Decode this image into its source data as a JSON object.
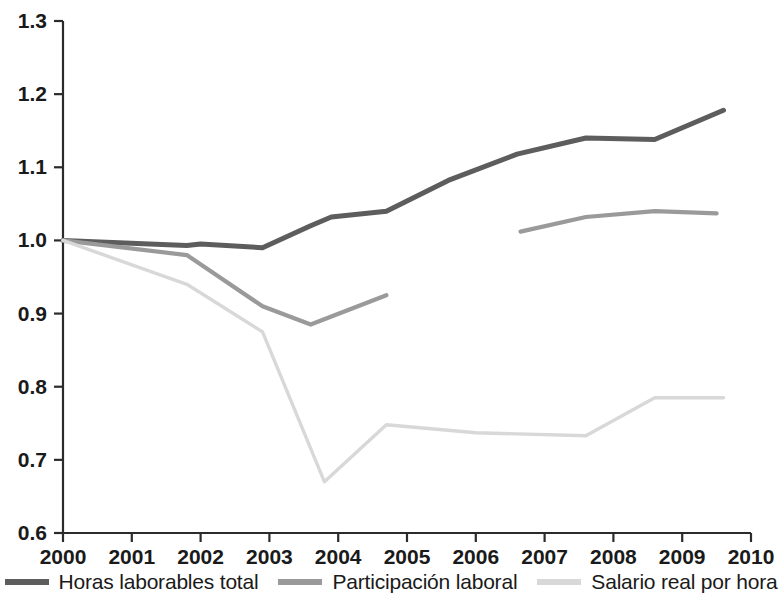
{
  "chart_data": {
    "type": "line",
    "title": "",
    "subtitle": "",
    "xlabel": "",
    "ylabel": "",
    "xlim": [
      2000,
      2010
    ],
    "ylim": [
      0.6,
      1.3
    ],
    "grid": false,
    "legend_position": "bottom",
    "x_ticks": [
      "2000",
      "2001",
      "2002",
      "2003",
      "2004",
      "2005",
      "2006",
      "2007",
      "2008",
      "2009",
      "2010"
    ],
    "y_ticks": [
      "0.6",
      "0.7",
      "0.8",
      "0.9",
      "1.0",
      "1.1",
      "1.2",
      "1.3"
    ],
    "colors": {
      "horas_laborables_total": "#5d5d5d",
      "participacion_laboral": "#9a9a9a",
      "salario_real_por_hora": "#d8d8d8"
    },
    "series": [
      {
        "name": "Horas laborables total",
        "color": "#5d5d5d",
        "x": [
          2000.0,
          2001.8,
          2002.0,
          2002.9,
          2003.6,
          2003.9,
          2004.7,
          2005.6,
          2006.6,
          2007.6,
          2008.6,
          2009.6
        ],
        "values": [
          1.0,
          0.993,
          0.995,
          0.99,
          1.02,
          1.032,
          1.04,
          1.082,
          1.118,
          1.14,
          1.138,
          1.178
        ]
      },
      {
        "name": "Participación laboral",
        "color": "#9a9a9a",
        "x": [
          2000.0,
          2001.8,
          2002.9,
          2003.6,
          2004.7,
          2006.65,
          2007.6,
          2008.6,
          2009.5
        ],
        "values": [
          1.0,
          0.98,
          0.91,
          0.885,
          0.925,
          1.012,
          1.032,
          1.04,
          1.037
        ],
        "gap_between": [
          2004.7,
          6.0
        ]
      },
      {
        "name": "Salario real por hora",
        "color": "#d8d8d8",
        "x": [
          2000.0,
          2001.8,
          2002.9,
          2003.8,
          2004.7,
          2006.0,
          2007.6,
          2008.6,
          2009.6
        ],
        "values": [
          1.0,
          0.94,
          0.875,
          0.67,
          0.748,
          0.737,
          0.733,
          0.785,
          0.785
        ]
      }
    ]
  },
  "legend": {
    "items": [
      {
        "label": "Horas laborables total",
        "color": "#5d5d5d"
      },
      {
        "label": "Participación laboral",
        "color": "#9a9a9a"
      },
      {
        "label": "Salario real por hora",
        "color": "#d8d8d8"
      }
    ]
  }
}
